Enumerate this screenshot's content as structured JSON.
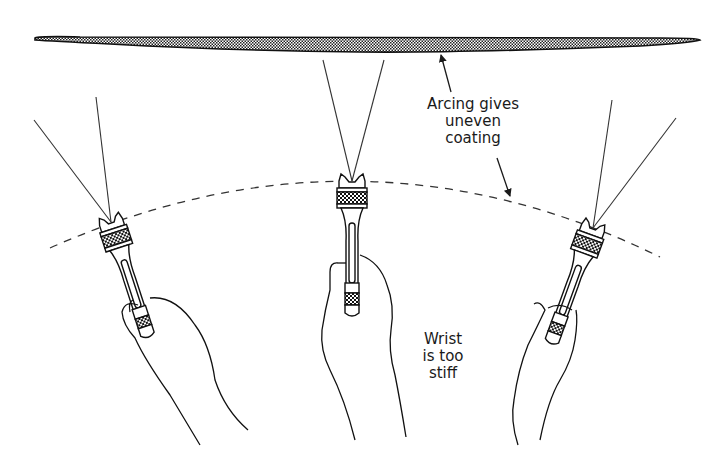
{
  "diagram": {
    "type": "technical illustration",
    "colors": {
      "ink": "#1a1a1a",
      "background": "#ffffff",
      "coating_fill": "#8c8c8c"
    }
  },
  "labels": {
    "arcing": {
      "lines": [
        "Arcing gives",
        "uneven",
        "coating"
      ]
    },
    "wrist": {
      "lines": [
        "Wrist",
        "is too",
        "stiff"
      ]
    }
  },
  "elements": {
    "coating_surface": "coating-band",
    "path": "dashed-arc-path",
    "guns": [
      {
        "position": "left",
        "tilt": "tilted left"
      },
      {
        "position": "center",
        "tilt": "vertical"
      },
      {
        "position": "right",
        "tilt": "tilted right"
      }
    ]
  }
}
